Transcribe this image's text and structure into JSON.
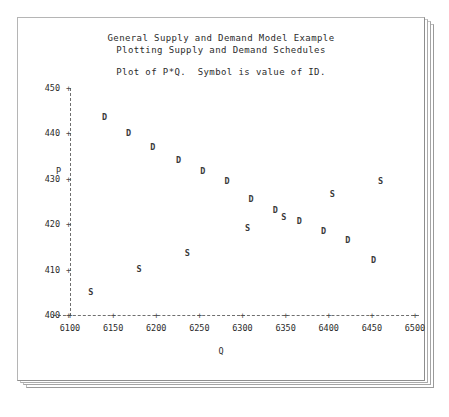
{
  "titles": {
    "line1": "General Supply and Demand Model Example",
    "line2": "Plotting Supply and Demand Schedules",
    "subtitle": "Plot of P*Q.  Symbol is value of ID."
  },
  "axes": {
    "y_title": "P",
    "x_title": "Q",
    "y_ticks": [
      "450",
      "440",
      "430",
      "420",
      "410",
      "400"
    ],
    "x_ticks": [
      "6100",
      "6150",
      "6200",
      "6250",
      "6300",
      "6350",
      "6400",
      "6450",
      "6500"
    ],
    "tick_glyph": "+"
  },
  "chart_data": {
    "type": "scatter",
    "subtitle": "Plot of P*Q.  Symbol is value of ID.",
    "xlabel": "Q",
    "ylabel": "P",
    "xlim": [
      6100,
      6500
    ],
    "ylim": [
      400,
      450
    ],
    "grid": false,
    "legend": "none",
    "series": [
      {
        "name": "D",
        "symbol": "D",
        "points": [
          {
            "x": 6140,
            "y": 443.5
          },
          {
            "x": 6168,
            "y": 440.0
          },
          {
            "x": 6196,
            "y": 437.0
          },
          {
            "x": 6226,
            "y": 434.0
          },
          {
            "x": 6254,
            "y": 431.5
          },
          {
            "x": 6282,
            "y": 429.5
          },
          {
            "x": 6310,
            "y": 425.5
          },
          {
            "x": 6338,
            "y": 423.0
          },
          {
            "x": 6366,
            "y": 420.5
          },
          {
            "x": 6394,
            "y": 418.5
          },
          {
            "x": 6422,
            "y": 416.5
          },
          {
            "x": 6452,
            "y": 412.0
          }
        ]
      },
      {
        "name": "S",
        "symbol": "S",
        "points": [
          {
            "x": 6124,
            "y": 405.0
          },
          {
            "x": 6180,
            "y": 410.0
          },
          {
            "x": 6236,
            "y": 413.5
          },
          {
            "x": 6306,
            "y": 419.0
          },
          {
            "x": 6348,
            "y": 421.5
          },
          {
            "x": 6404,
            "y": 426.5
          },
          {
            "x": 6460,
            "y": 429.5
          }
        ]
      }
    ]
  }
}
